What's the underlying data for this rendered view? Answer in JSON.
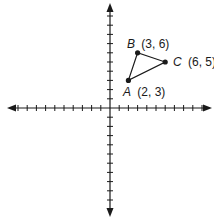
{
  "chart_data": {
    "type": "scatter",
    "title": "",
    "xlabel": "",
    "ylabel": "",
    "xlim": [
      -10,
      10
    ],
    "ylim": [
      -10,
      10
    ],
    "grid": false,
    "tick_interval": 1,
    "axes_arrows": true,
    "points": [
      {
        "name": "A",
        "x": 2,
        "y": 3,
        "label": "A",
        "coords": "(2, 3)"
      },
      {
        "name": "B",
        "x": 3,
        "y": 6,
        "label": "B",
        "coords": "(3, 6)"
      },
      {
        "name": "C",
        "x": 6,
        "y": 5,
        "label": "C",
        "coords": "(6, 5)"
      }
    ],
    "polygon": [
      "A",
      "B",
      "C"
    ],
    "annotations": [
      "A (2, 3)",
      "B (3, 6)",
      "C (6, 5)"
    ]
  },
  "labels": {
    "A": {
      "letter": "A",
      "coords": "(2, 3)"
    },
    "B": {
      "letter": "B",
      "coords": "(3, 6)"
    },
    "C": {
      "letter": "C",
      "coords": "(6, 5)"
    }
  },
  "colors": {
    "ink": "#1a1a1a",
    "background": "#ffffff"
  }
}
